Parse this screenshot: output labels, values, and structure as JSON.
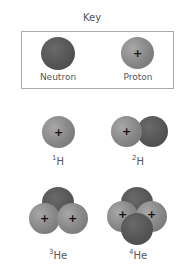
{
  "key": {
    "title": "Key",
    "items": [
      {
        "label": "Neutron",
        "type": "neutron",
        "color": "#555555"
      },
      {
        "label": "Proton",
        "type": "proton",
        "color": "#888888",
        "symbol": "+"
      }
    ]
  },
  "nuclei": [
    {
      "mass_number": "1",
      "element": "H",
      "protons": 1,
      "neutrons": 0
    },
    {
      "mass_number": "2",
      "element": "H",
      "protons": 1,
      "neutrons": 1
    },
    {
      "mass_number": "3",
      "element": "He",
      "protons": 2,
      "neutrons": 1
    },
    {
      "mass_number": "4",
      "element": "He",
      "protons": 2,
      "neutrons": 2
    }
  ],
  "proton_symbol": "+"
}
